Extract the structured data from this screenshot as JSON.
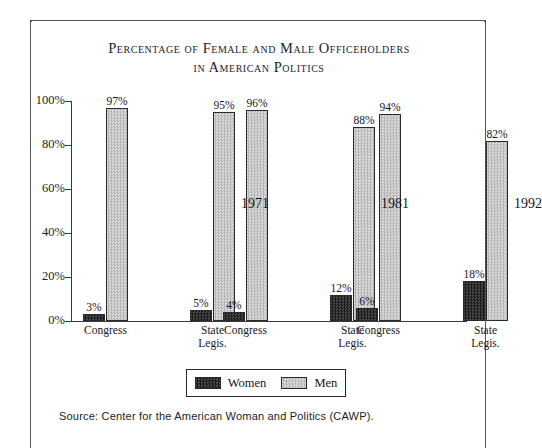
{
  "chart_data": {
    "type": "bar",
    "title_line1": "Percentage of Female and Male Officeholders",
    "title_line2": "in American Politics",
    "xlabel": "",
    "ylabel": "",
    "ylim": [
      0,
      100
    ],
    "grid": false,
    "legend_position": "bottom",
    "ytick_labels": [
      "100%",
      "80%",
      "60%",
      "40%",
      "20%",
      "0%"
    ],
    "ytick_values": [
      100,
      80,
      60,
      40,
      20,
      0
    ],
    "groups": [
      {
        "year": "1971",
        "categories": [
          "Congress",
          "State\nLegis."
        ],
        "women": [
          3,
          5
        ],
        "men": [
          97,
          95
        ],
        "women_labels": [
          "3%",
          "5%"
        ],
        "men_labels": [
          "97%",
          "95%"
        ]
      },
      {
        "year": "1981",
        "categories": [
          "Congress",
          "State\nLegis."
        ],
        "women": [
          4,
          12
        ],
        "men": [
          96,
          88
        ],
        "women_labels": [
          "4%",
          "12%"
        ],
        "men_labels": [
          "96%",
          "88%"
        ]
      },
      {
        "year": "1992",
        "categories": [
          "Congress",
          "State\nLegis."
        ],
        "women": [
          6,
          18
        ],
        "men": [
          94,
          82
        ],
        "women_labels": [
          "6%",
          "18%"
        ],
        "men_labels": [
          "94%",
          "82%"
        ]
      }
    ],
    "series": [
      {
        "name": "Women",
        "color": "#2e2e2e",
        "values": [
          3,
          5,
          4,
          12,
          6,
          18
        ]
      },
      {
        "name": "Men",
        "color": "#c9c9c9",
        "values": [
          97,
          95,
          96,
          88,
          94,
          82
        ]
      }
    ],
    "legend": [
      {
        "label": "Women",
        "color": "#2e2e2e"
      },
      {
        "label": "Men",
        "color": "#c9c9c9"
      }
    ],
    "source_note": "Source: Center for the American Woman and Politics (CAWP)."
  }
}
